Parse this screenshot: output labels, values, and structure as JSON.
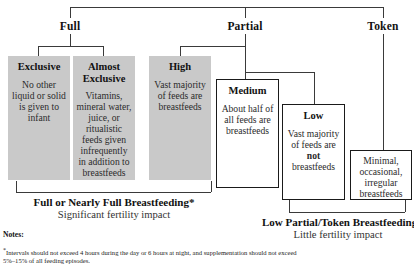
{
  "diagram": {
    "title_tiers": [
      {
        "id": "full",
        "label": "Full"
      },
      {
        "id": "partial",
        "label": "Partial"
      },
      {
        "id": "token",
        "label": "Token"
      }
    ],
    "categories": [
      {
        "id": "exclusive",
        "title": "Exclusive",
        "body": "No other liquid or solid is given to infant",
        "style": "gray"
      },
      {
        "id": "almost-exclusive",
        "title": "Almost Exclusive",
        "body": "Vitamins, mineral water, juice, or ritualistic feeds given infrequently in addition to breastfeeds",
        "style": "gray"
      },
      {
        "id": "high",
        "title": "High",
        "body": "Vast majority of feeds are breastfeeds",
        "style": "gray"
      },
      {
        "id": "medium",
        "title": "Medium",
        "body": "About half of all feeds are breastfeeds",
        "style": "white"
      },
      {
        "id": "low",
        "title": "Low",
        "body_pre": "Vast majority of feeds are",
        "body_emph": "not",
        "body_post": "breastfeeds",
        "style": "white"
      },
      {
        "id": "token",
        "title": "",
        "body": "Minimal, occasional, irregular breastfeeds",
        "style": "white"
      }
    ],
    "summaries": [
      {
        "id": "left-summary",
        "heading": "Full or Nearly Full Breastfeeding*",
        "subheading": "Significant fertility impact"
      },
      {
        "id": "right-summary",
        "heading": "Low Partial/Token Breastfeeding",
        "subheading": "Little fertility impact"
      }
    ],
    "notes": {
      "label": "Notes:",
      "footnote_marker": "*",
      "footnote_text": "Intervals should not exceed 4 hours during the day or 6 hours at night, and supplementation should not exceed 5%–15% of all feeding episodes."
    },
    "colors": {
      "gray_box": "#c9c9c9",
      "line": "#3a3a3a",
      "text": "#1a1a1a",
      "background": "#ffffff"
    }
  }
}
